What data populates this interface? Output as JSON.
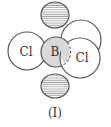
{
  "diagram": {
    "caption": "(I)",
    "atoms": {
      "central": "B",
      "ligand_left": "Cl",
      "ligand_right": "Cl"
    },
    "colors": {
      "outline": "#555555",
      "boron_fill": "#d9d9d9",
      "hatch": "#9a9a9a",
      "background": "#ffffff"
    },
    "elements": [
      {
        "name": "p-orbital-lobe-top",
        "style": "hatched"
      },
      {
        "name": "p-orbital-lobe-bottom",
        "style": "hatched"
      },
      {
        "name": "chlorine-left",
        "label": "Cl"
      },
      {
        "name": "chlorine-back-right",
        "label": ""
      },
      {
        "name": "chlorine-front-right",
        "label": "Cl"
      },
      {
        "name": "boron-center",
        "label": "B"
      }
    ]
  }
}
